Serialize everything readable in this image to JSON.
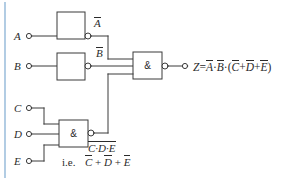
{
  "figure": {
    "kind": "logic-circuit-diagram",
    "width": 299,
    "height": 180,
    "background_color": "#ffffff",
    "accent_rule_color": "#9fc0dd",
    "line_color": "#3a3a3a"
  },
  "inputs": [
    {
      "id": "A",
      "label": "A",
      "terminal": "open-circle",
      "x": 24,
      "y": 36
    },
    {
      "id": "B",
      "label": "B",
      "terminal": "open-circle",
      "x": 24,
      "y": 66
    },
    {
      "id": "C",
      "label": "C",
      "terminal": "open-circle",
      "x": 24,
      "y": 108
    },
    {
      "id": "D",
      "label": "D",
      "terminal": "open-circle",
      "x": 24,
      "y": 134
    },
    {
      "id": "E",
      "label": "E",
      "terminal": "open-circle",
      "x": 24,
      "y": 161
    }
  ],
  "gates": [
    {
      "id": "not-a",
      "type": "inverter",
      "symbol": "",
      "has_output_bubble": true,
      "output_label": "A",
      "output_label_overbar": true
    },
    {
      "id": "not-b",
      "type": "inverter",
      "symbol": "",
      "has_output_bubble": true,
      "output_label": "B",
      "output_label_overbar": true
    },
    {
      "id": "nand-cde",
      "type": "nand",
      "symbol": "&",
      "has_output_bubble": true,
      "inputs": [
        "C",
        "D",
        "E"
      ]
    },
    {
      "id": "and-main",
      "type": "and-with-bubble",
      "symbol": "&",
      "has_output_bubble": true,
      "inputs": [
        "not-a",
        "not-b",
        "nand-cde"
      ]
    }
  ],
  "annotations": {
    "out_a": "A",
    "out_b": "B",
    "nand_out_line1_terms": "C·D·E",
    "nand_out_line2_prefix": "i.e.",
    "nand_out_line2_c": "C",
    "nand_out_line2_d": "D",
    "nand_out_line2_e": "E",
    "nand_out_line2_plus1": "+",
    "nand_out_line2_plus2": "+"
  },
  "output": {
    "terminal": "open-circle",
    "z_symbol": "Z",
    "equals": "=",
    "term_a": "A",
    "dot1": "·",
    "term_b": "B",
    "dot2": "·",
    "open_paren": "(",
    "term_c": "C",
    "plus1": "+",
    "term_d": "D",
    "plus2": "+",
    "term_e": "E",
    "close_paren": ")",
    "full_expression": "Z = Ā·B̄·(C̄+D̄+Ē)"
  }
}
